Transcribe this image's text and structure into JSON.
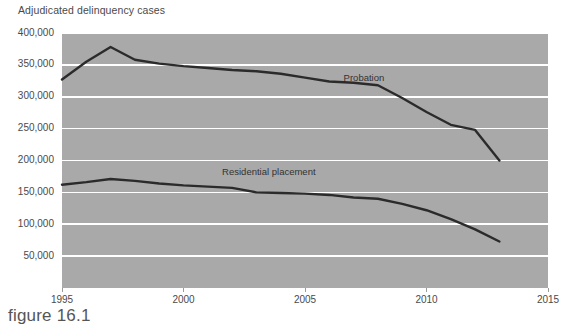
{
  "figure": {
    "caption": "figure 16.1"
  },
  "chart_data": {
    "type": "line",
    "title": "Adjudicated delinquency cases",
    "xlabel": "",
    "ylabel": "",
    "grid": true,
    "legend_position": "inline-annotation",
    "plot_background": "#a9a9a9",
    "gridline_color": "#ffffff",
    "line_color": "#2b2b2b",
    "xlim": [
      1995,
      2015
    ],
    "ylim": [
      0,
      400000
    ],
    "xticks": [
      1995,
      2000,
      2005,
      2010,
      2015
    ],
    "xtick_labels": [
      "1995",
      "2000",
      "2005",
      "2010",
      "2015"
    ],
    "yticks": [
      50000,
      100000,
      150000,
      200000,
      250000,
      300000,
      350000,
      400000
    ],
    "ytick_labels": [
      "50,000",
      "100,000",
      "150,000",
      "200,000",
      "250,000",
      "300,000",
      "350,000",
      "400,000"
    ],
    "x": [
      1995,
      1996,
      1997,
      1998,
      1999,
      2000,
      2001,
      2002,
      2003,
      2004,
      2005,
      2006,
      2007,
      2008,
      2009,
      2010,
      2011,
      2012,
      2013
    ],
    "series": [
      {
        "name": "Probation",
        "label_x": 2007,
        "label_y": 330000,
        "values": [
          327000,
          355000,
          378000,
          358000,
          352000,
          348000,
          345000,
          342000,
          340000,
          336000,
          330000,
          324000,
          322000,
          318000,
          298000,
          276000,
          256000,
          248000,
          200000
        ]
      },
      {
        "name": "Residential placement",
        "label_x": 2002,
        "label_y": 182000,
        "values": [
          162000,
          166000,
          171000,
          168000,
          164000,
          161000,
          159000,
          157000,
          150000,
          149000,
          148000,
          146000,
          142000,
          140000,
          132000,
          122000,
          108000,
          92000,
          73000
        ]
      }
    ],
    "annotations": [
      {
        "text": "Probation"
      },
      {
        "text": "Residential placement"
      }
    ]
  }
}
